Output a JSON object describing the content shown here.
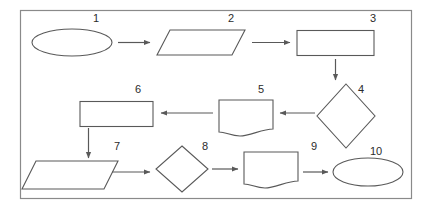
{
  "diagram": {
    "background_color": "#ffffff",
    "frame": {
      "stroke_color": "#8a8a8a",
      "fill_color": "#ffffff",
      "x": 20,
      "y": 10,
      "width": 392,
      "height": 189
    },
    "shape_stroke_color": "#595959",
    "shape_fill_color": "#ffffff",
    "connector_color": "#595959",
    "label_color": "#2b2b2b",
    "nodes": [
      {
        "id": "node-1",
        "number": "1",
        "shape": "ellipse",
        "label_x": 96,
        "label_y": 19
      },
      {
        "id": "node-2",
        "number": "2",
        "shape": "parallelogram",
        "label_x": 231,
        "label_y": 19
      },
      {
        "id": "node-3",
        "number": "3",
        "shape": "rectangle",
        "label_x": 373,
        "label_y": 19
      },
      {
        "id": "node-4",
        "number": "4",
        "shape": "diamond",
        "label_x": 361,
        "label_y": 90
      },
      {
        "id": "node-5",
        "number": "5",
        "shape": "document",
        "label_x": 261,
        "label_y": 90
      },
      {
        "id": "node-6",
        "number": "6",
        "shape": "rectangle",
        "label_x": 138,
        "label_y": 90
      },
      {
        "id": "node-7",
        "number": "7",
        "shape": "parallelogram",
        "label_x": 117,
        "label_y": 147
      },
      {
        "id": "node-8",
        "number": "8",
        "shape": "diamond",
        "label_x": 205,
        "label_y": 147
      },
      {
        "id": "node-9",
        "number": "9",
        "shape": "document",
        "label_x": 314,
        "label_y": 147
      },
      {
        "id": "node-10",
        "number": "10",
        "shape": "ellipse",
        "label_x": 376,
        "label_y": 152
      }
    ],
    "connectors": [
      {
        "id": "arrow-1-2",
        "from": "node-1",
        "to": "node-2",
        "direction": "right"
      },
      {
        "id": "arrow-2-3",
        "from": "node-2",
        "to": "node-3",
        "direction": "right"
      },
      {
        "id": "arrow-3-4",
        "from": "node-3",
        "to": "node-4",
        "direction": "down"
      },
      {
        "id": "arrow-4-5",
        "from": "node-4",
        "to": "node-5",
        "direction": "left"
      },
      {
        "id": "arrow-5-6",
        "from": "node-5",
        "to": "node-6",
        "direction": "left"
      },
      {
        "id": "arrow-6-7",
        "from": "node-6",
        "to": "node-7",
        "direction": "down"
      },
      {
        "id": "arrow-7-8",
        "from": "node-7",
        "to": "node-8",
        "direction": "right"
      },
      {
        "id": "arrow-8-9",
        "from": "node-8",
        "to": "node-9",
        "direction": "right"
      },
      {
        "id": "arrow-9-10",
        "from": "node-9",
        "to": "node-10",
        "direction": "right"
      }
    ]
  }
}
